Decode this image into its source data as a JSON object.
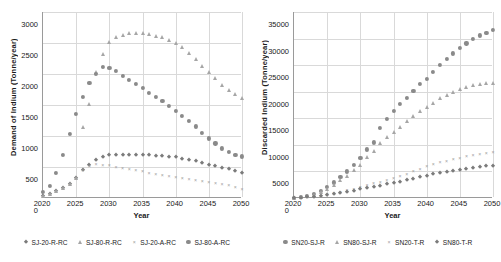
{
  "chart_data": [
    {
      "type": "scatter",
      "title": "",
      "xlabel": "Year",
      "ylabel": "Demand of Indium (Tonne/year)",
      "xlim": [
        2020,
        2050
      ],
      "ylim": [
        0,
        3000
      ],
      "xticks": [
        2020,
        2025,
        2030,
        2035,
        2040,
        2045,
        2050
      ],
      "yticks": [
        0,
        500,
        1000,
        1500,
        2000,
        2500,
        3000
      ],
      "grid": true,
      "legend_position": "bottom",
      "x": [
        2020,
        2021,
        2022,
        2023,
        2024,
        2025,
        2026,
        2027,
        2028,
        2029,
        2030,
        2031,
        2032,
        2033,
        2034,
        2035,
        2036,
        2037,
        2038,
        2039,
        2040,
        2041,
        2042,
        2043,
        2044,
        2045,
        2046,
        2047,
        2048,
        2049,
        2050
      ],
      "series": [
        {
          "name": "SJ-20-R-RC",
          "marker": "diamond",
          "color": "#7b7b7b",
          "values": [
            30,
            60,
            105,
            160,
            230,
            330,
            450,
            540,
            610,
            660,
            690,
            700,
            700,
            700,
            698,
            695,
            690,
            685,
            675,
            665,
            655,
            635,
            615,
            590,
            565,
            540,
            515,
            490,
            465,
            435,
            405
          ]
        },
        {
          "name": "SJ-80-R-RC",
          "marker": "triangle",
          "color": "#a6a6a6",
          "values": [
            30,
            60,
            105,
            160,
            230,
            330,
            1140,
            1520,
            2030,
            2330,
            2520,
            2590,
            2630,
            2660,
            2665,
            2660,
            2640,
            2620,
            2590,
            2555,
            2505,
            2430,
            2340,
            2240,
            2135,
            2030,
            1930,
            1830,
            1740,
            1670,
            1620
          ]
        },
        {
          "name": "SJ-20-A-RC",
          "marker": "cross",
          "color": "#9e9e9e",
          "values": [
            30,
            60,
            105,
            160,
            230,
            330,
            450,
            520,
            545,
            540,
            525,
            505,
            490,
            470,
            450,
            430,
            410,
            390,
            370,
            350,
            335,
            320,
            305,
            290,
            275,
            260,
            245,
            230,
            215,
            185,
            150
          ]
        },
        {
          "name": "SJ-80-A-RC",
          "marker": "circle",
          "color": "#8a8a8a",
          "values": [
            100,
            200,
            400,
            700,
            1030,
            1360,
            1630,
            1860,
            2000,
            2120,
            2100,
            2050,
            1975,
            1900,
            1840,
            1770,
            1700,
            1630,
            1560,
            1490,
            1410,
            1330,
            1240,
            1155,
            1050,
            960,
            880,
            800,
            740,
            700,
            670
          ]
        }
      ]
    },
    {
      "type": "scatter",
      "title": "",
      "xlabel": "Year",
      "ylabel": "Discarded Indium (Tonne/year)",
      "xlim": [
        2020,
        2050
      ],
      "ylim": [
        0,
        35000
      ],
      "xticks": [
        2020,
        2025,
        2030,
        2035,
        2040,
        2045,
        2050
      ],
      "yticks": [
        0,
        5000,
        10000,
        15000,
        20000,
        25000,
        30000,
        35000
      ],
      "grid": true,
      "legend_position": "bottom",
      "x": [
        2020,
        2021,
        2022,
        2023,
        2024,
        2025,
        2026,
        2027,
        2028,
        2029,
        2030,
        2031,
        2032,
        2033,
        2034,
        2035,
        2036,
        2037,
        2038,
        2039,
        2040,
        2041,
        2042,
        2043,
        2044,
        2045,
        2046,
        2047,
        2048,
        2049,
        2050
      ],
      "series": [
        {
          "name": "SN20-SJ-R",
          "marker": "circle",
          "color": "#8a8a8a",
          "values": [
            80,
            200,
            400,
            800,
            1400,
            2050,
            2950,
            3950,
            5000,
            6300,
            7500,
            9150,
            10450,
            13200,
            14850,
            16350,
            17650,
            18900,
            20200,
            21500,
            22400,
            23800,
            25100,
            26200,
            27200,
            28300,
            29100,
            29900,
            30600,
            31100,
            31600
          ]
        },
        {
          "name": "SN80-SJ-R",
          "marker": "triangle",
          "color": "#a6a6a6",
          "values": [
            60,
            160,
            330,
            650,
            1150,
            1700,
            2450,
            3300,
            4200,
            5250,
            6250,
            7650,
            8800,
            10300,
            11400,
            12400,
            13450,
            14400,
            15400,
            16300,
            17100,
            17950,
            18750,
            19400,
            20000,
            20500,
            20900,
            21200,
            21450,
            21600,
            21700
          ]
        },
        {
          "name": "SN20-T-R",
          "marker": "cross",
          "color": "#9e9e9e",
          "values": [
            40,
            90,
            170,
            300,
            470,
            680,
            900,
            1150,
            1450,
            1750,
            2050,
            2400,
            2750,
            3100,
            3450,
            3800,
            4200,
            4600,
            5000,
            5500,
            5950,
            6350,
            6700,
            7000,
            7300,
            7600,
            7900,
            8150,
            8350,
            8550,
            8700
          ]
        },
        {
          "name": "SN80-T-R",
          "marker": "diamond",
          "color": "#7b7b7b",
          "values": [
            30,
            70,
            130,
            230,
            360,
            520,
            700,
            900,
            1120,
            1350,
            1600,
            1850,
            2100,
            2350,
            2600,
            2850,
            3100,
            3350,
            3600,
            3900,
            4200,
            4450,
            4700,
            4900,
            5100,
            5300,
            5500,
            5700,
            5850,
            6000,
            6100
          ]
        }
      ]
    }
  ],
  "left_chart": {
    "ylabel": "Demand of Indium (Tonne/year)",
    "xlabel": "Year",
    "yticks": [
      "3000",
      "2500",
      "2000",
      "1500",
      "1000",
      "500",
      "0"
    ],
    "xticks": [
      "2020",
      "2025",
      "2030",
      "2035",
      "2040",
      "2045",
      "2050"
    ],
    "legend": [
      {
        "label": "SJ-20-R-RC",
        "marker": "diamond"
      },
      {
        "label": "SJ-80-R-RC",
        "marker": "triangle"
      },
      {
        "label": "SJ-20-A-RC",
        "marker": "cross"
      },
      {
        "label": "SJ-80-A-RC",
        "marker": "circle"
      }
    ]
  },
  "right_chart": {
    "ylabel": "Discarded Indium (Tonne/year)",
    "xlabel": "Year",
    "yticks": [
      "35000",
      "30000",
      "25000",
      "20000",
      "15000",
      "10000",
      "5000",
      "0"
    ],
    "xticks": [
      "2020",
      "2025",
      "2030",
      "2035",
      "2040",
      "2045",
      "2050"
    ],
    "legend": [
      {
        "label": "SN20-SJ-R",
        "marker": "circle"
      },
      {
        "label": "SN80-SJ-R",
        "marker": "triangle"
      },
      {
        "label": "SN20-T-R",
        "marker": "cross"
      },
      {
        "label": "SN80-T-R",
        "marker": "diamond"
      }
    ]
  }
}
